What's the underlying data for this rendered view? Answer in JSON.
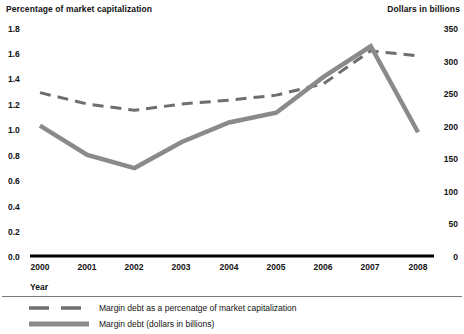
{
  "axes": {
    "left_title": "Percentage of market capitalization",
    "right_title": "Dollars in billions",
    "x_axis_name": "Year",
    "left_ticks": [
      "1.8",
      "1.6",
      "1.4",
      "1.2",
      "1.0",
      "0.8",
      "0.6",
      "0.4",
      "0.2",
      "0.0"
    ],
    "right_ticks": [
      "350",
      "300",
      "250",
      "200",
      "150",
      "100",
      "50",
      "0"
    ],
    "x_ticks": [
      "2000",
      "2001",
      "2002",
      "2003",
      "2004",
      "2005",
      "2006",
      "2007",
      "2008"
    ]
  },
  "legend": {
    "items": [
      {
        "label": "Margin debt as a percenatge of market capitalization",
        "style": "dashed",
        "color": "#6e6e6e",
        "icon": "dashed-line-swatch"
      },
      {
        "label": "Margin debt (dollars in billions)",
        "style": "solid",
        "color": "#8a8a8a",
        "icon": "solid-line-swatch"
      }
    ]
  },
  "colors": {
    "percentage_line": "#6e6e6e",
    "dollars_line": "#8a8a8a",
    "axis": "#000000",
    "text": "#111111"
  },
  "chart_data": {
    "type": "line",
    "title": "",
    "xlabel": "Year",
    "categories": [
      "2000",
      "2001",
      "2002",
      "2003",
      "2004",
      "2005",
      "2006",
      "2007",
      "2008"
    ],
    "grid": false,
    "legend_position": "bottom",
    "series": [
      {
        "name": "Margin debt as a percenatge of market capitalization",
        "axis": "left",
        "ylabel": "Percentage of market capitalization",
        "ylim": [
          0.0,
          1.8
        ],
        "style": "dashed",
        "color": "#6e6e6e",
        "values": [
          1.29,
          1.2,
          1.15,
          1.2,
          1.23,
          1.27,
          1.36,
          1.62,
          1.58
        ]
      },
      {
        "name": "Margin debt (dollars in billions)",
        "axis": "right",
        "ylabel": "Dollars in billions",
        "ylim": [
          0,
          350
        ],
        "style": "solid",
        "color": "#8a8a8a",
        "values": [
          200,
          155,
          135,
          175,
          205,
          220,
          275,
          322,
          190
        ]
      }
    ]
  }
}
